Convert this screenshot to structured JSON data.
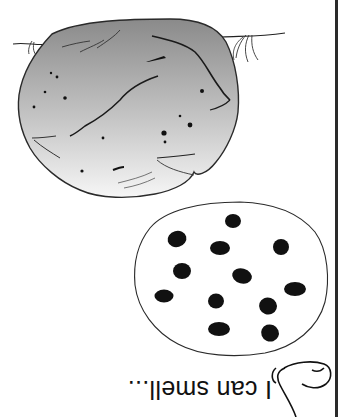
{
  "worksheet": {
    "orientation": "upside-down (rotated 180°)",
    "caption": "I can smell...",
    "icons": {
      "nose": "nose-icon",
      "cookie": "chocolate-chip-cookie-icon",
      "potato": "potato-icon"
    },
    "colors": {
      "ink": "#222222",
      "potato_gradient_top": "#8c8c8c",
      "potato_gradient_bottom": "#f5f5f5",
      "edge": "#2a2a2a",
      "background": "#ffffff"
    },
    "cookie_chip_count": 12
  }
}
